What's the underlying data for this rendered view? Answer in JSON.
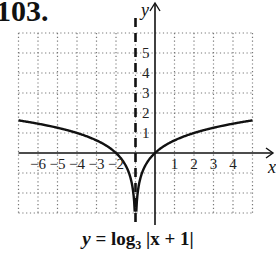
{
  "problem_number": "103.",
  "caption": {
    "y_var": "y",
    "equals": " = log",
    "base": "3",
    "arg": " |x + 1|"
  },
  "chart_data": {
    "type": "line",
    "title": "y = log3 |x + 1|",
    "function": "log3(|x + 1|)",
    "xlabel": "x",
    "ylabel": "y",
    "xlim": [
      -7,
      5
    ],
    "ylim": [
      -3,
      6
    ],
    "grid": true,
    "grid_style": "dotted",
    "x_tick_labels": [
      {
        "value": -6,
        "label": "−6"
      },
      {
        "value": -5,
        "label": "−5"
      },
      {
        "value": -4,
        "label": "−4"
      },
      {
        "value": -3,
        "label": "−3"
      },
      {
        "value": -2,
        "label": "−2"
      },
      {
        "value": 1,
        "label": "1"
      },
      {
        "value": 2,
        "label": "2"
      },
      {
        "value": 3,
        "label": "3"
      },
      {
        "value": 4,
        "label": "4"
      }
    ],
    "y_tick_labels": [
      {
        "value": 1,
        "label": "1"
      },
      {
        "value": 2,
        "label": "2"
      },
      {
        "value": 3,
        "label": "3"
      },
      {
        "value": 4,
        "label": "4"
      },
      {
        "value": 5,
        "label": "5"
      }
    ],
    "asymptote": {
      "type": "vertical",
      "x": -1,
      "style": "dashed"
    },
    "series": [
      {
        "name": "left branch",
        "points": [
          [
            -7,
            1.893
          ],
          [
            -6,
            1.631
          ],
          [
            -5,
            1.262
          ],
          [
            -4,
            1.0
          ],
          [
            -3,
            0.631
          ],
          [
            -2,
            0.0
          ],
          [
            -1.5,
            -0.631
          ],
          [
            -1.2,
            -1.465
          ],
          [
            -1.1,
            -2.096
          ],
          [
            -1.06,
            -2.561
          ]
        ]
      },
      {
        "name": "right branch",
        "points": [
          [
            -0.94,
            -2.561
          ],
          [
            -0.9,
            -2.096
          ],
          [
            -0.8,
            -1.465
          ],
          [
            -0.5,
            -0.631
          ],
          [
            0,
            0.0
          ],
          [
            1,
            0.631
          ],
          [
            2,
            1.0
          ],
          [
            3,
            1.262
          ],
          [
            4,
            1.465
          ],
          [
            5,
            1.631
          ]
        ]
      }
    ]
  }
}
